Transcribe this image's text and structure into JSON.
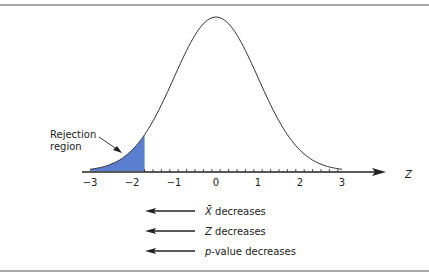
{
  "figure": {
    "annotation": {
      "line1": "Rejection",
      "line2": "region"
    },
    "axis": {
      "label": "Z",
      "ticks": [
        "−3",
        "−2",
        "−1",
        "0",
        "1",
        "2",
        "3"
      ]
    },
    "legend": [
      {
        "symbol": "X̄",
        "text": " decreases"
      },
      {
        "symbol": "Z",
        "text": " decreases"
      },
      {
        "symbol": "p",
        "text": "-value decreases"
      }
    ],
    "colors": {
      "shade": "#5b7fd0",
      "line": "#222222"
    }
  },
  "chart_data": {
    "type": "area",
    "title": "",
    "xlabel": "Z",
    "ylabel": "",
    "xlim": [
      -3,
      3
    ],
    "x_ticks": [
      -3,
      -2,
      -1,
      0,
      1,
      2,
      3
    ],
    "curve": "standard normal density",
    "shaded_region": {
      "from": -3,
      "to": -1.7,
      "label": "Rejection region"
    },
    "annotations": [
      "X̄ decreases",
      "Z decreases",
      "p-value decreases"
    ]
  }
}
